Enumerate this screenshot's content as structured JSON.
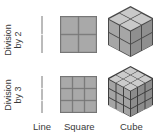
{
  "rows": [
    {
      "label_line1": "Division",
      "label_line2": "by 2",
      "divisions": 2
    },
    {
      "label_line1": "Division",
      "label_line2": "by 3",
      "divisions": 3
    }
  ],
  "columns": [
    {
      "label": "Line"
    },
    {
      "label": "Square"
    },
    {
      "label": "Cube"
    }
  ],
  "colors": {
    "face_fill": "#a8a8a8",
    "face_top": "#c4c4c4",
    "face_right": "#959595",
    "grout": "#6a6a6a",
    "line": "#777777"
  }
}
